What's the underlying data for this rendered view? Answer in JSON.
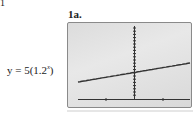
{
  "page": {
    "corner_label": "1",
    "figure_label": "1a.",
    "equation": {
      "prefix": "y = 5(1.2",
      "exponent": "x",
      "suffix": ")"
    }
  },
  "chart_data": {
    "type": "line",
    "title": "1a.",
    "function": "y = 5(1.2^x)",
    "xlabel": "",
    "ylabel": "",
    "grid": false,
    "legend": null,
    "x": [
      -10,
      -8,
      -6,
      -4,
      -2,
      0,
      2,
      4,
      6,
      8,
      10
    ],
    "series": [
      {
        "name": "y = 5(1.2^x)",
        "values": [
          0.81,
          1.16,
          1.67,
          2.41,
          3.47,
          5.0,
          7.2,
          10.37,
          14.93,
          21.5,
          30.96
        ]
      }
    ],
    "colors": {
      "screen_background": "#dedede",
      "curve": "#333333",
      "axes": "#333333",
      "frame": "#8a8a8a"
    }
  }
}
